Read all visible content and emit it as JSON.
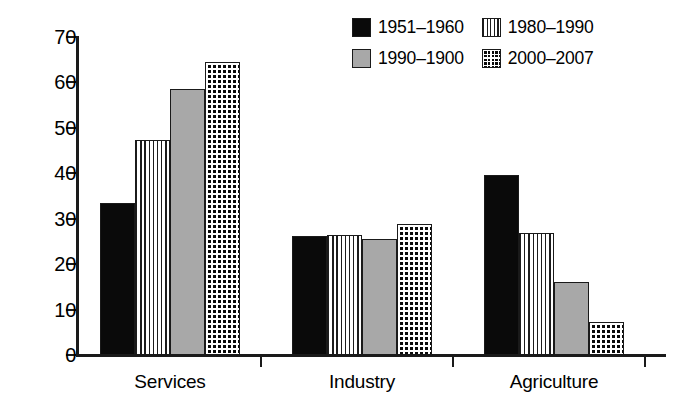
{
  "chart_data": {
    "type": "bar",
    "title": "",
    "xlabel": "",
    "ylabel": "",
    "ylim": [
      0,
      70
    ],
    "yticks": [
      "0",
      "10",
      "20",
      "30",
      "40",
      "50",
      "60",
      "70"
    ],
    "ytick_values": [
      0,
      10,
      20,
      30,
      40,
      50,
      60,
      70
    ],
    "grid": false,
    "legend_position": "top-right",
    "categories": [
      "Services",
      "Industry",
      "Agriculture"
    ],
    "series": [
      {
        "name": "1951–1960",
        "pattern": "solid-black",
        "color": "#0a0a0a",
        "values": [
          33.4,
          26.1,
          39.6
        ]
      },
      {
        "name": "1980–1990",
        "pattern": "vertical-stripes",
        "color": "#ffffff",
        "values": [
          47.3,
          26.4,
          26.8
        ]
      },
      {
        "name": "1990–1900",
        "pattern": "solid-gray",
        "color": "#a8a8a8",
        "values": [
          58.6,
          25.5,
          16.0
        ]
      },
      {
        "name": "2000–2007",
        "pattern": "crosshatch",
        "color": "#0a0a0a",
        "values": [
          64.5,
          28.8,
          7.3
        ]
      }
    ]
  },
  "legend": {
    "entries": [
      {
        "label": "1951–1960",
        "swatch": "solid-black"
      },
      {
        "label": "1980–1990",
        "swatch": "vertical-stripes"
      },
      {
        "label": "1990–1900",
        "swatch": "solid-gray"
      },
      {
        "label": "2000–2007",
        "swatch": "crosshatch"
      }
    ]
  },
  "axes": {
    "y_tick_labels": [
      "70",
      "60",
      "50",
      "40",
      "30",
      "20",
      "10",
      "0"
    ],
    "x_category_labels": [
      "Services",
      "Industry",
      "Agriculture"
    ]
  }
}
